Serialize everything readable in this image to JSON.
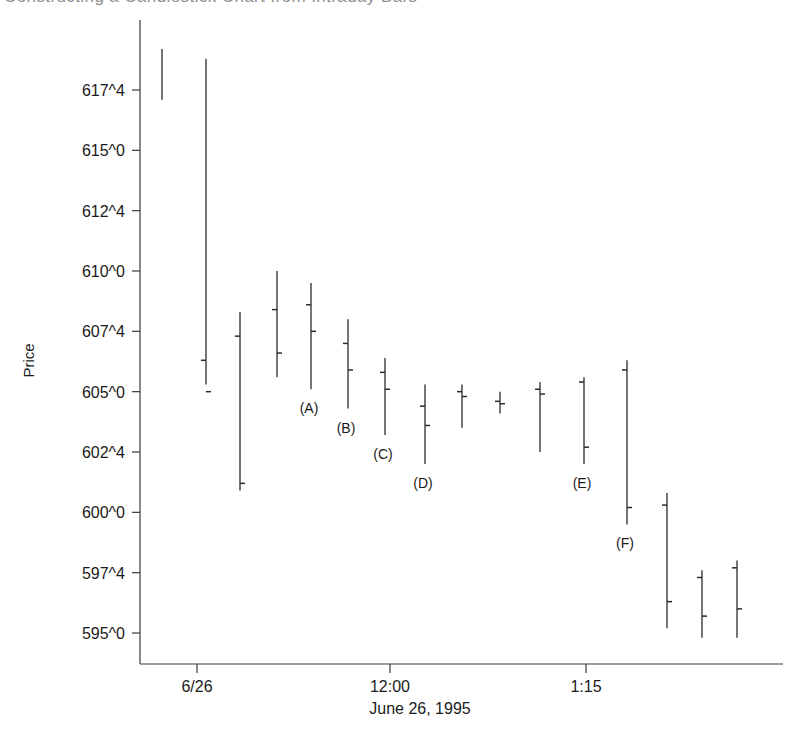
{
  "figure": {
    "cut_off_title": "Constructing a Candlestick Chart from Intraday Bars",
    "ylabel": "Price",
    "xlabel": "June 26, 1995"
  },
  "chart_data": {
    "type": "bar",
    "subtype": "ohlc-bar",
    "title": "",
    "xlabel": "June 26, 1995",
    "ylabel": "Price",
    "ylim": [
      594.0,
      619.0
    ],
    "grid": false,
    "legend": null,
    "y_ticks": [
      {
        "label": "617^4",
        "value": 617.5
      },
      {
        "label": "615^0",
        "value": 615.0
      },
      {
        "label": "612^4",
        "value": 612.5
      },
      {
        "label": "610^0",
        "value": 610.0
      },
      {
        "label": "607^4",
        "value": 607.5
      },
      {
        "label": "605^0",
        "value": 605.0
      },
      {
        "label": "602^4",
        "value": 602.5
      },
      {
        "label": "600^0",
        "value": 600.0
      },
      {
        "label": "597^4",
        "value": 597.5
      },
      {
        "label": "595^0",
        "value": 595.0
      }
    ],
    "x_ticks": [
      {
        "label": "6/26",
        "px": 197
      },
      {
        "label": "12:00",
        "px": 390
      },
      {
        "label": "1:15",
        "px": 586
      }
    ],
    "bars": [
      {
        "id": "bar-01",
        "px": 162,
        "high": 619.2,
        "low": 617.1,
        "open": null,
        "close": null,
        "annotation": null
      },
      {
        "id": "bar-02",
        "px": 206,
        "high": 618.8,
        "low": 605.3,
        "open": 606.3,
        "close": 605.0,
        "annotation": null
      },
      {
        "id": "bar-03",
        "px": 240,
        "high": 608.3,
        "low": 600.9,
        "open": 607.3,
        "close": 601.2,
        "annotation": null
      },
      {
        "id": "bar-04",
        "px": 277,
        "high": 610.0,
        "low": 605.6,
        "open": 608.4,
        "close": 606.6,
        "annotation": null
      },
      {
        "id": "bar-05",
        "px": 311,
        "high": 609.5,
        "low": 605.1,
        "open": 608.6,
        "close": 607.5,
        "annotation": "(A)"
      },
      {
        "id": "bar-06",
        "px": 348,
        "high": 608.0,
        "low": 604.3,
        "open": 607.0,
        "close": 605.9,
        "annotation": "(B)"
      },
      {
        "id": "bar-07",
        "px": 385,
        "high": 606.4,
        "low": 603.2,
        "open": 605.8,
        "close": 605.1,
        "annotation": "(C)"
      },
      {
        "id": "bar-08",
        "px": 425,
        "high": 605.3,
        "low": 602.0,
        "open": 604.4,
        "close": 603.6,
        "annotation": "(D)"
      },
      {
        "id": "bar-09",
        "px": 462,
        "high": 605.3,
        "low": 603.5,
        "open": 605.0,
        "close": 604.8,
        "annotation": null
      },
      {
        "id": "bar-10",
        "px": 500,
        "high": 605.0,
        "low": 604.1,
        "open": 604.6,
        "close": 604.5,
        "annotation": null
      },
      {
        "id": "bar-11",
        "px": 540,
        "high": 605.4,
        "low": 602.5,
        "open": 605.1,
        "close": 604.9,
        "annotation": null
      },
      {
        "id": "bar-12",
        "px": 584,
        "high": 605.6,
        "low": 602.0,
        "open": 605.4,
        "close": 602.7,
        "annotation": "(E)"
      },
      {
        "id": "bar-13",
        "px": 627,
        "high": 606.3,
        "low": 599.5,
        "open": 605.9,
        "close": 600.2,
        "annotation": "(F)"
      },
      {
        "id": "bar-14",
        "px": 667,
        "high": 600.8,
        "low": 595.2,
        "open": 600.3,
        "close": 596.3,
        "annotation": null
      },
      {
        "id": "bar-15",
        "px": 702,
        "high": 597.6,
        "low": 594.8,
        "open": 597.3,
        "close": 595.7,
        "annotation": null
      },
      {
        "id": "bar-16",
        "px": 737,
        "high": 598.0,
        "low": 594.8,
        "open": 597.7,
        "close": 596.0,
        "annotation": null
      }
    ],
    "annotations": [
      {
        "label": "(A)",
        "bar": "bar-05"
      },
      {
        "label": "(B)",
        "bar": "bar-06"
      },
      {
        "label": "(C)",
        "bar": "bar-07"
      },
      {
        "label": "(D)",
        "bar": "bar-08"
      },
      {
        "label": "(E)",
        "bar": "bar-12"
      },
      {
        "label": "(F)",
        "bar": "bar-13"
      }
    ],
    "colors": {
      "bar": "#2b2b2b",
      "axis": "#3a3a3a",
      "text": "#1a1a1a",
      "background": "#ffffff"
    }
  }
}
